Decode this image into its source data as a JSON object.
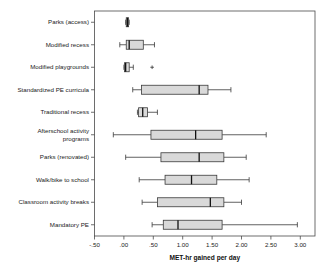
{
  "chart_data": {
    "type": "box",
    "title": "",
    "xlabel": "MET-hr gained per day",
    "ylabel": "",
    "orientation": "horizontal",
    "xlim": [
      -0.5,
      3.25
    ],
    "grid": false,
    "legend": "none",
    "xticks": [
      -0.5,
      0.0,
      0.5,
      1.0,
      1.5,
      2.0,
      2.5,
      3.0
    ],
    "xtick_labels": [
      "-.50",
      ".00",
      ".50",
      "1.00",
      "1.50",
      "2.00",
      "2.50",
      "3.00"
    ],
    "categories": [
      "Parks (access)",
      "Modified recess",
      "Modified playgrounds",
      "Standardized PE curricula",
      "Traditional recess",
      "Afterschool activity programs",
      "Parks (renovated)",
      "Walk/bike to school",
      "Classroom activity breaks",
      "Mandatory PE"
    ],
    "boxes": [
      {
        "category": "Parks (access)",
        "whisker_low": 0.03,
        "q1": 0.04,
        "median": 0.06,
        "q3": 0.08,
        "whisker_high": 0.09,
        "outliers": []
      },
      {
        "category": "Modified recess",
        "whisker_low": -0.07,
        "q1": 0.04,
        "median": 0.09,
        "q3": 0.33,
        "whisker_high": 0.52,
        "outliers": []
      },
      {
        "category": "Modified playgrounds",
        "whisker_low": 0.0,
        "q1": 0.01,
        "median": 0.03,
        "q3": 0.09,
        "whisker_high": 0.16,
        "outliers": [
          0.48
        ]
      },
      {
        "category": "Standardized PE curricula",
        "whisker_low": 0.15,
        "q1": 0.3,
        "median": 1.28,
        "q3": 1.43,
        "whisker_high": 1.82,
        "outliers": []
      },
      {
        "category": "Traditional recess",
        "whisker_low": 0.23,
        "q1": 0.25,
        "median": 0.32,
        "q3": 0.4,
        "whisker_high": 0.57,
        "outliers": []
      },
      {
        "category": "Afterschool activity programs",
        "whisker_low": -0.18,
        "q1": 0.46,
        "median": 1.22,
        "q3": 1.67,
        "whisker_high": 2.42,
        "outliers": []
      },
      {
        "category": "Parks (renovated)",
        "whisker_low": 0.03,
        "q1": 0.63,
        "median": 1.28,
        "q3": 1.7,
        "whisker_high": 2.08,
        "outliers": []
      },
      {
        "category": "Walk/bike to school",
        "whisker_low": 0.26,
        "q1": 0.7,
        "median": 1.15,
        "q3": 1.58,
        "whisker_high": 2.13,
        "outliers": []
      },
      {
        "category": "Classroom activity breaks",
        "whisker_low": 0.31,
        "q1": 0.57,
        "median": 1.47,
        "q3": 1.7,
        "whisker_high": 2.0,
        "outliers": []
      },
      {
        "category": "Mandatory PE",
        "whisker_low": 0.48,
        "q1": 0.67,
        "median": 0.92,
        "q3": 1.67,
        "whisker_high": 2.95,
        "outliers": []
      }
    ]
  },
  "axis": {
    "x_title": "MET-hr gained per day"
  },
  "colors": {
    "box_fill": "#d9d9d9",
    "box_stroke": "#3a3a3a",
    "median": "#111111",
    "axis": "#4a4a4a",
    "text": "#222222",
    "background": "#ffffff"
  }
}
